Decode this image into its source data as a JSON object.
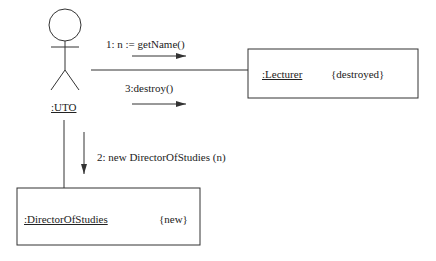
{
  "diagram": {
    "type": "UML collaboration diagram",
    "actor": {
      "label": ":UTO"
    },
    "objects": [
      {
        "id": "lecturer",
        "name": ":Lecturer",
        "constraint": "{destroyed}"
      },
      {
        "id": "director",
        "name": ":DirectorOfStudies",
        "constraint": "{new}"
      }
    ],
    "messages": [
      {
        "label": "1: n := getName()",
        "from": ":UTO",
        "to": ":Lecturer"
      },
      {
        "label": "2: new DirectorOfStudies (n)",
        "from": ":UTO",
        "to": ":DirectorOfStudies"
      },
      {
        "label": "3:destroy()",
        "from": ":UTO",
        "to": ":Lecturer"
      }
    ],
    "colors": {
      "line": "#333333",
      "background": "#ffffff"
    }
  }
}
